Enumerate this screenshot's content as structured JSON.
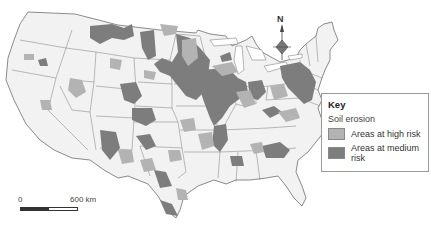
{
  "map": {
    "subject": "Soil erosion risk in the contiguous United States",
    "colors": {
      "background": "#ffffff",
      "land": "#f2f2f2",
      "borders": "#6e6e6e",
      "high_risk": "#b3b3b3",
      "medium_risk": "#7d7d7d"
    }
  },
  "compass": {
    "label": "N",
    "icon": "north-arrow-icon"
  },
  "scale_bar": {
    "start_label": "0",
    "end_label": "600 km"
  },
  "key": {
    "title": "Key",
    "subtitle": "Soil erosion",
    "items": [
      {
        "label": "Areas at high risk",
        "color": "#b3b3b3"
      },
      {
        "label": "Areas at medium risk",
        "color": "#7d7d7d"
      }
    ]
  }
}
